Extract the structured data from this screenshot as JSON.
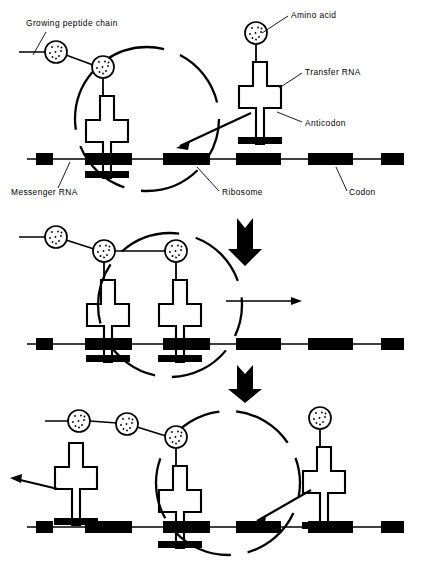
{
  "figure": {
    "title_semantic": "protein-synthesis-translation-diagram",
    "background_color": "#ffffff",
    "ink_color": "#000000",
    "panel_count": 3
  },
  "labels": {
    "growing_peptide_chain": "Growing peptide chain",
    "amino_acid": "Amino acid",
    "transfer_rna": "Transfer RNA",
    "anticodon": "Anticodon",
    "messenger_rna": "Messenger RNA",
    "ribosome": "Ribosome",
    "codon": "Codon"
  },
  "label_positions": {
    "growing_peptide_chain": {
      "x": 26,
      "y": 26
    },
    "amino_acid": {
      "x": 291,
      "y": 18
    },
    "transfer_rna": {
      "x": 305,
      "y": 75
    },
    "anticodon": {
      "x": 305,
      "y": 126
    },
    "messenger_rna": {
      "x": 11,
      "y": 195
    },
    "ribosome": {
      "x": 222,
      "y": 195
    },
    "codon": {
      "x": 349,
      "y": 195
    }
  },
  "leader_lines": [
    {
      "name": "leader-growing-peptide-chain",
      "x1": 46,
      "y1": 32,
      "x2": 33,
      "y2": 55
    },
    {
      "name": "leader-amino-acid",
      "x1": 288,
      "y1": 16,
      "x2": 262,
      "y2": 33
    },
    {
      "name": "leader-transfer-rna",
      "x1": 302,
      "y1": 73,
      "x2": 279,
      "y2": 88
    },
    {
      "name": "leader-anticodon",
      "x1": 302,
      "y1": 122,
      "x2": 277,
      "y2": 112
    },
    {
      "name": "leader-messenger-rna",
      "x1": 58,
      "y1": 188,
      "x2": 70,
      "y2": 162
    },
    {
      "name": "leader-ribosome",
      "x1": 219,
      "y1": 191,
      "x2": 197,
      "y2": 167
    },
    {
      "name": "leader-codon",
      "x1": 347,
      "y1": 191,
      "x2": 336,
      "y2": 167
    }
  ],
  "mrna": {
    "strand_color": "#000000",
    "codon_fill": "#000000",
    "codon_height": 12,
    "strand_y_panel1": 159,
    "strand_y_panel2": 344,
    "strand_y_panel3": 527,
    "strand_x_start": 27,
    "strand_x_end": 404,
    "codons": [
      {
        "index": 1,
        "x": 36,
        "width": 17,
        "partial": true
      },
      {
        "index": 2,
        "x": 85,
        "width": 47
      },
      {
        "index": 3,
        "x": 163,
        "width": 47
      },
      {
        "index": 4,
        "x": 236,
        "width": 45
      },
      {
        "index": 5,
        "x": 308,
        "width": 45
      },
      {
        "index": 6,
        "x": 381,
        "width": 23,
        "partial": true
      }
    ]
  },
  "panels": [
    {
      "id": "panel-1",
      "name": "panel-initiation",
      "ribosome": {
        "cx": 147,
        "cy": 119,
        "r": 72,
        "style": "dashed-circle"
      },
      "peptide_chain": {
        "tail_x1": 19,
        "tail_y1": 52,
        "amino_acids": [
          {
            "cx": 56,
            "cy": 52,
            "r": 11
          },
          {
            "cx": 103,
            "cy": 67,
            "r": 11
          }
        ]
      },
      "trnas": [
        {
          "name": "trna-bound-left",
          "x": 103,
          "y": 78,
          "charged": true,
          "anticodon_bound": true
        },
        {
          "name": "trna-incoming-right",
          "x": 256,
          "y": 45,
          "charged": true,
          "anticodon_bound": false
        }
      ],
      "free_amino_acid": {
        "cx": 256,
        "cy": 33,
        "r": 11
      },
      "arrows": [
        {
          "name": "arrow-trna-entering",
          "type": "thin",
          "x1": 251,
          "y1": 113,
          "x2": 177,
          "y2": 147
        }
      ]
    },
    {
      "id": "panel-2",
      "name": "panel-elongation",
      "ribosome": {
        "cx": 170,
        "cy": 305,
        "r": 72,
        "style": "dashed-circle"
      },
      "peptide_chain": {
        "tail_x1": 19,
        "tail_y1": 237,
        "amino_acids": [
          {
            "cx": 56,
            "cy": 237,
            "r": 11
          },
          {
            "cx": 104,
            "cy": 251,
            "r": 11
          },
          {
            "cx": 176,
            "cy": 251,
            "r": 11
          }
        ]
      },
      "trnas": [
        {
          "name": "trna-bound-p-site",
          "x": 104,
          "y": 262,
          "charged": true,
          "anticodon_bound": true
        },
        {
          "name": "trna-bound-a-site",
          "x": 176,
          "y": 262,
          "charged": true,
          "anticodon_bound": true
        }
      ],
      "arrows": [
        {
          "name": "arrow-step-down-1",
          "type": "thick",
          "x": 245,
          "y1": 218,
          "y2": 266
        },
        {
          "name": "arrow-ribosome-moves-right",
          "type": "thin",
          "x1": 226,
          "y1": 301,
          "x2": 301,
          "y2": 301
        }
      ]
    },
    {
      "id": "panel-3",
      "name": "panel-translocation",
      "ribosome": {
        "cx": 228,
        "cy": 483,
        "r": 72,
        "style": "dashed-circle"
      },
      "peptide_chain": {
        "tail_x1": 45,
        "tail_y1": 421,
        "amino_acids": [
          {
            "cx": 79,
            "cy": 421,
            "r": 11
          },
          {
            "cx": 127,
            "cy": 424,
            "r": 11
          },
          {
            "cx": 176,
            "cy": 437,
            "r": 11
          }
        ]
      },
      "trnas": [
        {
          "name": "trna-departing-left",
          "x": 72,
          "y": 443,
          "charged": false,
          "anticodon_bound": false
        },
        {
          "name": "trna-bound-center",
          "x": 176,
          "y": 448,
          "charged": true,
          "anticodon_bound": true
        },
        {
          "name": "trna-incoming-right",
          "x": 320,
          "y": 430,
          "charged": true,
          "anticodon_bound": false
        }
      ],
      "free_amino_acid": {
        "cx": 320,
        "cy": 418,
        "r": 11
      },
      "arrows": [
        {
          "name": "arrow-step-down-2",
          "type": "thick",
          "x": 245,
          "y1": 365,
          "y2": 403
        },
        {
          "name": "arrow-trna-exits-left",
          "type": "thin",
          "x1": 58,
          "y1": 489,
          "x2": 10,
          "y2": 478
        },
        {
          "name": "arrow-trna-entering",
          "type": "thin",
          "x1": 311,
          "y1": 490,
          "x2": 253,
          "y2": 524
        }
      ]
    }
  ],
  "trna_shape": {
    "description": "cross-shaped transfer RNA with narrow top stem, wide arms, narrow neck, wide base and solid black anticodon bar",
    "stem_width": 14,
    "arm_width": 50,
    "total_height": 82,
    "anticodon_bar_fill": "#000000"
  },
  "amino_acid_shape": {
    "description": "open circle with stippled dot interior",
    "fill": "#ffffff",
    "stroke": "#000000",
    "dot_count": 9
  }
}
